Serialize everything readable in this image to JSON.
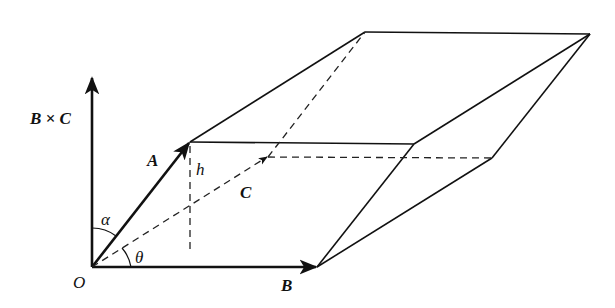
{
  "diagram": {
    "colors": {
      "stroke": "#111111",
      "background": "#ffffff"
    },
    "labels": {
      "cross": "B × C",
      "a": "A",
      "b": "B",
      "c": "C",
      "h": "h",
      "o": "O",
      "alpha": "α",
      "theta": "θ"
    },
    "points": {
      "O": [
        92,
        267
      ],
      "A": [
        190,
        142
      ],
      "B": [
        317,
        267
      ],
      "C": [
        268,
        157
      ],
      "AB": [
        414,
        144
      ],
      "AC": [
        365,
        32
      ],
      "BC": [
        492,
        158
      ],
      "ABC": [
        590,
        34
      ],
      "axisTop": [
        92,
        77
      ],
      "hFoot": [
        190,
        252
      ]
    },
    "vectors": [
      {
        "name": "A",
        "from": "O",
        "to": "A",
        "style": "solid"
      },
      {
        "name": "B",
        "from": "O",
        "to": "B",
        "style": "solid"
      },
      {
        "name": "C",
        "from": "O",
        "to": "C",
        "style": "dashed"
      },
      {
        "name": "B×C",
        "from": "O",
        "to": "axisTop",
        "style": "solid"
      }
    ],
    "edges_solid": [
      [
        "A",
        "AB"
      ],
      [
        "A",
        "AC"
      ],
      [
        "AC",
        "ABC"
      ],
      [
        "AB",
        "ABC"
      ],
      [
        "B",
        "AB"
      ],
      [
        "B",
        "BC"
      ],
      [
        "BC",
        "ABC"
      ]
    ],
    "edges_dashed": [
      [
        "C",
        "AC"
      ],
      [
        "C",
        "BC"
      ],
      [
        "A",
        "hFoot"
      ]
    ],
    "angles": [
      {
        "name": "alpha",
        "between": [
          "B×C",
          "A"
        ]
      },
      {
        "name": "theta",
        "between": [
          "B",
          "C"
        ]
      }
    ]
  }
}
